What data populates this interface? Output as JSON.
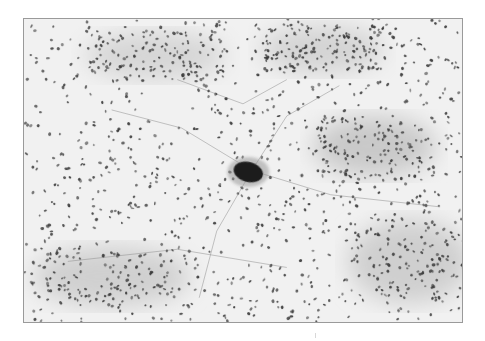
{
  "figure": {
    "kind": "grayscale histology micrograph",
    "frame": {
      "x": 23,
      "y": 18,
      "width": 440,
      "height": 305,
      "border_color": "#9a9a9a"
    },
    "background_color": "#f1f1f1",
    "nucleus_color": "#3a3a3a",
    "nucleus_count": 1400,
    "seed": 7,
    "dense_regions": [
      {
        "cx": 0.8,
        "cy": 0.42,
        "rx": 0.14,
        "ry": 0.1,
        "shade": "#c9c9c9"
      },
      {
        "cx": 0.88,
        "cy": 0.8,
        "rx": 0.14,
        "ry": 0.14,
        "shade": "#cfcfcf"
      },
      {
        "cx": 0.2,
        "cy": 0.85,
        "rx": 0.18,
        "ry": 0.1,
        "shade": "#d0d0d0"
      },
      {
        "cx": 0.3,
        "cy": 0.12,
        "rx": 0.16,
        "ry": 0.08,
        "shade": "#d6d6d6"
      },
      {
        "cx": 0.68,
        "cy": 0.1,
        "rx": 0.14,
        "ry": 0.08,
        "shade": "#d4d4d4"
      }
    ],
    "large_cell": {
      "cx": 0.512,
      "cy": 0.505,
      "rx": 15,
      "ry": 10,
      "rotation": 15,
      "color": "#1a1a1a"
    },
    "fibers": [
      [
        [
          0.52,
          0.5
        ],
        [
          0.36,
          0.36
        ],
        [
          0.2,
          0.3
        ]
      ],
      [
        [
          0.52,
          0.5
        ],
        [
          0.6,
          0.32
        ],
        [
          0.72,
          0.22
        ]
      ],
      [
        [
          0.52,
          0.5
        ],
        [
          0.7,
          0.58
        ],
        [
          0.95,
          0.62
        ]
      ],
      [
        [
          0.52,
          0.5
        ],
        [
          0.44,
          0.7
        ],
        [
          0.4,
          0.92
        ]
      ],
      [
        [
          0.1,
          0.8
        ],
        [
          0.35,
          0.76
        ],
        [
          0.6,
          0.82
        ]
      ],
      [
        [
          0.35,
          0.2
        ],
        [
          0.5,
          0.28
        ],
        [
          0.6,
          0.2
        ]
      ]
    ]
  }
}
